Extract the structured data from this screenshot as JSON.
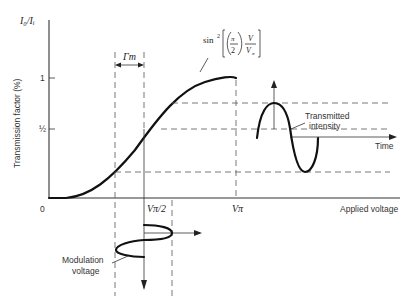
{
  "diagram": {
    "title_formula": "sin²[(π/2) V/Vπ]",
    "y_axis": {
      "top_label": "I₀/Iᵢ",
      "label": "Transmission factor (%)",
      "ticks": [
        "1",
        "½"
      ]
    },
    "x_axis": {
      "origin": "0",
      "label": "Applied voltage",
      "ticks": [
        "Vπ/2",
        "Vπ"
      ]
    },
    "annotations": {
      "gamma": "Γm",
      "transmitted": [
        "Transmitted",
        "intensity"
      ],
      "time": "Time",
      "modulation": [
        "Modulation",
        "voltage"
      ]
    },
    "formula_parts": {
      "sin": "sin",
      "exp": "2",
      "pi": "π",
      "two": "2",
      "V": "V",
      "Vpi": "V",
      "pi_sub": "π"
    }
  }
}
